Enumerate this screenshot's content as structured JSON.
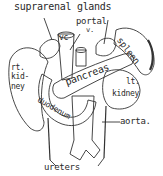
{
  "figure": {
    "labels": {
      "suprarenal": "suprarenal glands",
      "portal_1": "portal",
      "portal_2": "v.",
      "vc": "vc",
      "rt_kidney_1": "rt.",
      "rt_kidney_2": "kid-",
      "rt_kidney_3": "ney",
      "spleen": "spleen",
      "pancreas": "pancreas",
      "duodenum": "duodenum",
      "lt_kidney_1": "lt.",
      "lt_kidney_2": "kidney",
      "aorta": "aorta.",
      "ureters": "ureters"
    },
    "colors": {
      "ink": "#2a2a2a",
      "background": "#ffffff"
    }
  }
}
